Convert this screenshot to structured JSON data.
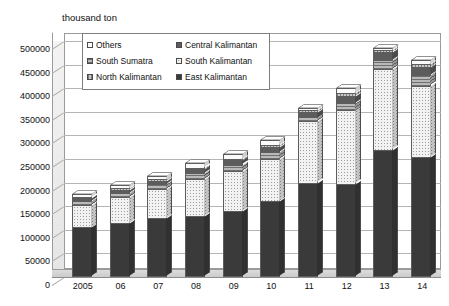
{
  "chart_data": {
    "type": "bar",
    "stacked": true,
    "title": "",
    "subtitle": "",
    "unit_label": "thousand ton",
    "ylabel": "thousand ton",
    "xlabel": "",
    "categories": [
      "2005",
      "06",
      "07",
      "08",
      "09",
      "10",
      "11",
      "12",
      "13",
      "14"
    ],
    "ylim": [
      0,
      500000
    ],
    "ytick_step": 50000,
    "yticks": [
      0,
      50000,
      100000,
      150000,
      200000,
      250000,
      300000,
      350000,
      400000,
      450000,
      500000
    ],
    "grid": true,
    "legend_position": "top-left-inside",
    "series": [
      {
        "name": "East Kalimantan",
        "pattern": "solid-dark",
        "color": "#3a3a3a",
        "values": [
          105000,
          115000,
          125000,
          130000,
          140000,
          160000,
          200000,
          198000,
          270000,
          255000
        ]
      },
      {
        "name": "South Kalimantan",
        "pattern": "fine-dots",
        "color": "#f2f2f2",
        "values": [
          48000,
          55000,
          62000,
          78000,
          85000,
          90000,
          130000,
          155000,
          170000,
          150000
        ]
      },
      {
        "name": "South Sumatra",
        "pattern": "horizontal-lines",
        "color": "#b9b9b9",
        "values": [
          8000,
          9000,
          10000,
          12000,
          13000,
          15000,
          8000,
          16000,
          20000,
          22000
        ]
      },
      {
        "name": "Central Kalimantan",
        "pattern": "solid-gray",
        "color": "#5c5c5c",
        "values": [
          6000,
          6000,
          7000,
          8000,
          9000,
          10000,
          12000,
          14000,
          16000,
          18000
        ]
      },
      {
        "name": "North Kalimantan",
        "pattern": "vertical-lines",
        "color": "#c8c8c8",
        "values": [
          2000,
          3000,
          3000,
          4000,
          4000,
          5000,
          4000,
          6000,
          4000,
          7000
        ]
      },
      {
        "name": "Others",
        "pattern": "white",
        "color": "#fbfbfb",
        "values": [
          6000,
          7000,
          8000,
          9000,
          10000,
          10000,
          4000,
          11000,
          5000,
          8000
        ]
      }
    ],
    "totals": [
      175000,
      195000,
      215000,
      241000,
      261000,
      290000,
      358000,
      400000,
      485000,
      460000
    ]
  },
  "legend": {
    "items": [
      {
        "label": "Others",
        "swatch": "white"
      },
      {
        "label": "Central Kalimantan",
        "swatch": "solid-gray"
      },
      {
        "label": "South Sumatra",
        "swatch": "horizontal-lines"
      },
      {
        "label": "South Kalimantan",
        "swatch": "fine-dots"
      },
      {
        "label": "North Kalimantan",
        "swatch": "vertical-lines"
      },
      {
        "label": "East Kalimantan",
        "swatch": "solid-dark"
      }
    ]
  }
}
